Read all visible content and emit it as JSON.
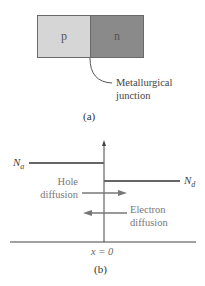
{
  "panel_a": {
    "p_label": "p",
    "n_label": "n",
    "junction_label_line1": "Metallurgical",
    "junction_label_line2": "junction",
    "caption": "(a)",
    "colors": {
      "p_region": "#d6d6d6",
      "n_region": "#8a8a8a"
    }
  },
  "panel_b": {
    "na_label": "N",
    "na_sub": "a",
    "nd_label": "N",
    "nd_sub": "d",
    "hole_line1": "Hole",
    "hole_line2": "diffusion",
    "electron_line1": "Electron",
    "electron_line2": "diffusion",
    "x_label": "x = 0",
    "caption": "(b)",
    "colors": {
      "line": "#666666",
      "axis": "#444444"
    }
  }
}
